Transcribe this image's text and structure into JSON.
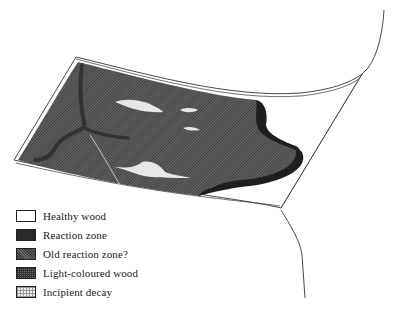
{
  "figure": {
    "regions": [
      {
        "id": "healthy-wood",
        "fill": "#ffffff"
      },
      {
        "id": "reaction-zone",
        "fill": "#2a2a2a"
      },
      {
        "id": "old-reaction-zone",
        "fill": "#505050"
      },
      {
        "id": "light-coloured-wood",
        "fill": "#5c5c5c"
      },
      {
        "id": "incipient-decay",
        "fill": "#e8e8e8"
      }
    ]
  },
  "legend": {
    "items": [
      {
        "label": "Healthy wood",
        "swatch": "healthy"
      },
      {
        "label": "Reaction zone",
        "swatch": "reaction"
      },
      {
        "label": "Old reaction zone?",
        "swatch": "old"
      },
      {
        "label": "Light-coloured wood",
        "swatch": "light"
      },
      {
        "label": "Incipient decay",
        "swatch": "incipient"
      }
    ]
  }
}
